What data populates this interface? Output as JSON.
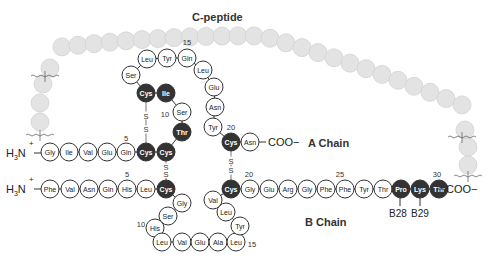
{
  "title": "C-peptide",
  "labels": {
    "a_chain": "A Chain",
    "b_chain": "B Chain",
    "n_terminus": "H3N+",
    "c_terminus": "COO−",
    "b28": "B28",
    "b29": "B29",
    "disulfide": "S"
  },
  "colors": {
    "residue_fill": "#ffffff",
    "residue_stroke": "#333333",
    "highlight_fill": "#333333",
    "highlight_text": "#ffffff",
    "cpeptide_fill": "#e3e3e3",
    "cpeptide_stroke": "#d2d2d2"
  },
  "a_chain": [
    {
      "pos": 1,
      "aa": "Gly",
      "dark": false
    },
    {
      "pos": 2,
      "aa": "Ile",
      "dark": false
    },
    {
      "pos": 3,
      "aa": "Val",
      "dark": false
    },
    {
      "pos": 4,
      "aa": "Glu",
      "dark": false
    },
    {
      "pos": 5,
      "aa": "Gln",
      "dark": false
    },
    {
      "pos": 6,
      "aa": "Cys",
      "dark": true
    },
    {
      "pos": 7,
      "aa": "Cys",
      "dark": true
    },
    {
      "pos": 8,
      "aa": "Thr",
      "dark": true
    },
    {
      "pos": 9,
      "aa": "Ser",
      "dark": false
    },
    {
      "pos": 10,
      "aa": "Ile",
      "dark": true
    },
    {
      "pos": 11,
      "aa": "Cys",
      "dark": true
    },
    {
      "pos": 12,
      "aa": "Ser",
      "dark": false
    },
    {
      "pos": 13,
      "aa": "Leu",
      "dark": false
    },
    {
      "pos": 14,
      "aa": "Tyr",
      "dark": false
    },
    {
      "pos": 15,
      "aa": "Gln",
      "dark": false
    },
    {
      "pos": 16,
      "aa": "Leu",
      "dark": false
    },
    {
      "pos": 17,
      "aa": "Glu",
      "dark": false
    },
    {
      "pos": 18,
      "aa": "Asn",
      "dark": false
    },
    {
      "pos": 19,
      "aa": "Tyr",
      "dark": false
    },
    {
      "pos": 20,
      "aa": "Cys",
      "dark": true
    },
    {
      "pos": 21,
      "aa": "Asn",
      "dark": false
    }
  ],
  "b_chain": [
    {
      "pos": 1,
      "aa": "Phe",
      "dark": false
    },
    {
      "pos": 2,
      "aa": "Val",
      "dark": false
    },
    {
      "pos": 3,
      "aa": "Asn",
      "dark": false
    },
    {
      "pos": 4,
      "aa": "Gln",
      "dark": false
    },
    {
      "pos": 5,
      "aa": "His",
      "dark": false
    },
    {
      "pos": 6,
      "aa": "Leu",
      "dark": false
    },
    {
      "pos": 7,
      "aa": "Cys",
      "dark": true
    },
    {
      "pos": 8,
      "aa": "Gly",
      "dark": false
    },
    {
      "pos": 9,
      "aa": "Ser",
      "dark": false
    },
    {
      "pos": 10,
      "aa": "His",
      "dark": false
    },
    {
      "pos": 11,
      "aa": "Leu",
      "dark": false
    },
    {
      "pos": 12,
      "aa": "Val",
      "dark": false
    },
    {
      "pos": 13,
      "aa": "Glu",
      "dark": false
    },
    {
      "pos": 14,
      "aa": "Ala",
      "dark": false
    },
    {
      "pos": 15,
      "aa": "Leu",
      "dark": false
    },
    {
      "pos": 16,
      "aa": "Tyr",
      "dark": false
    },
    {
      "pos": 17,
      "aa": "Leu",
      "dark": false
    },
    {
      "pos": 18,
      "aa": "Val",
      "dark": false
    },
    {
      "pos": 19,
      "aa": "Cys",
      "dark": true
    },
    {
      "pos": 20,
      "aa": "Gly",
      "dark": false
    },
    {
      "pos": 21,
      "aa": "Glu",
      "dark": false
    },
    {
      "pos": 22,
      "aa": "Arg",
      "dark": false
    },
    {
      "pos": 23,
      "aa": "Gly",
      "dark": false
    },
    {
      "pos": 24,
      "aa": "Phe",
      "dark": false
    },
    {
      "pos": 25,
      "aa": "Phe",
      "dark": false
    },
    {
      "pos": 26,
      "aa": "Tyr",
      "dark": false
    },
    {
      "pos": 27,
      "aa": "Thr",
      "dark": false
    },
    {
      "pos": 28,
      "aa": "Pro",
      "dark": true
    },
    {
      "pos": 29,
      "aa": "Lys",
      "dark": true
    },
    {
      "pos": 30,
      "aa": "Thr",
      "dark": true
    }
  ],
  "a_numbers": [
    "5",
    "10",
    "15",
    "20"
  ],
  "b_numbers": [
    "5",
    "10",
    "15",
    "20",
    "25",
    "30"
  ],
  "disulfide_bonds": [
    "A6-A11",
    "A7-B7",
    "A20-B19"
  ],
  "c_peptide_residue_count": 35
}
